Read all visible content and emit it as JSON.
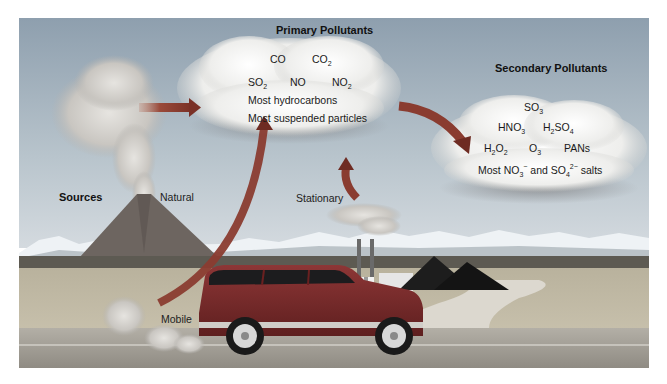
{
  "diagram": {
    "primary": {
      "title": "Primary Pollutants",
      "row1": [
        {
          "base": "CO",
          "sub": ""
        },
        {
          "base": "CO",
          "sub": "2"
        }
      ],
      "row2": [
        {
          "base": "SO",
          "sub": "2"
        },
        {
          "base": "NO",
          "sub": ""
        },
        {
          "base": "NO",
          "sub": "2"
        }
      ],
      "line3": "Most hydrocarbons",
      "line4": "Most suspended particles"
    },
    "secondary": {
      "title": "Secondary Pollutants",
      "so3": {
        "base": "SO",
        "sub": "3"
      },
      "hno3": {
        "base": "HNO",
        "sub": "3"
      },
      "h2so4": {
        "pre": "H",
        "sub1": "2",
        "mid": "SO",
        "sub2": "4"
      },
      "h2o2": {
        "pre": "H",
        "sub1": "2",
        "mid": "O",
        "sub2": "2"
      },
      "o3": {
        "base": "O",
        "sub": "3"
      },
      "pans": "PANs",
      "salts": {
        "pre": "Most NO",
        "sub1": "3",
        "sup1": "−",
        "mid": " and SO",
        "sub2": "4",
        "sup2": "2−",
        "post": " salts"
      }
    },
    "sources": {
      "heading": "Sources",
      "natural": "Natural",
      "stationary": "Stationary",
      "mobile": "Mobile"
    },
    "colors": {
      "sky_top": "#8e9fae",
      "sky_bottom": "#c9d2d8",
      "arrow": "#9a4a3a",
      "arrow_dark": "#6e2b22",
      "cloud": "#f4f4f2",
      "plain": "#c8bfa9",
      "road": "#a7a39a",
      "suv": "#7a2a2a",
      "coal": "#1a1a1a",
      "volcano": "#6d6560",
      "snow": "#eef2f5"
    }
  }
}
